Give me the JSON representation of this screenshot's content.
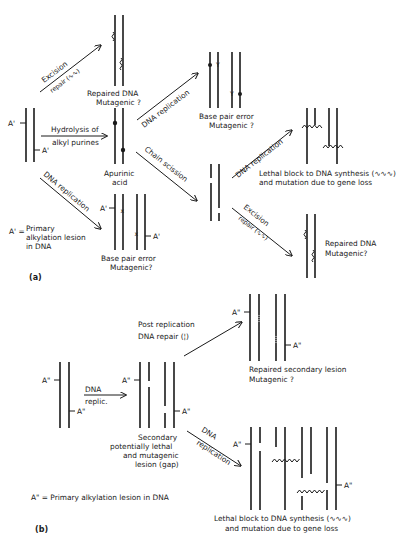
{
  "panel_a": {
    "label": "(a)",
    "start_lesion": "A'",
    "legend_line1": "A' =",
    "legend_line2": "Primary",
    "legend_line3": "alkylation lesion",
    "legend_line4": "in DNA",
    "arrows": {
      "excision_repair_1": "Excision",
      "excision_repair_2": "repair (∿∿)",
      "hydrolysis_1": "Hydrolysis of",
      "hydrolysis_2": "alkyl purines",
      "dna_replication_lower": "DNA replication",
      "dna_replication_upper": "DNA replication",
      "chain_scission": "Chain scission",
      "dna_replication_right": "DNA replication",
      "excision_repair_right_1": "Excision",
      "excision_repair_right_2": "repair (∿∿)"
    },
    "outcomes": {
      "repaired_top_1": "Repaired DNA",
      "repaired_top_2": "Mutagenic ?",
      "apurinic_1": "Apurinic",
      "apurinic_2": "acid",
      "bp_error_top_1": "Base pair error",
      "bp_error_top_2": "Mutagenic ?",
      "bp_error_bottom_1": "Base pair error",
      "bp_error_bottom_2": "Mutagenic?",
      "lethal_1": "Lethal block to DNA synthesis (∿∿∿)",
      "lethal_2": "and mutation due to gene loss",
      "repaired_right_1": "Repaired DNA",
      "repaired_right_2": "Mutagenic?"
    }
  },
  "panel_b": {
    "label": "(b)",
    "lesion": "A\"",
    "legend": "A\" = Primary alkylation lesion in DNA",
    "arrows": {
      "dna_replic_1": "DNA",
      "dna_replic_2": "replic.",
      "post_rep_1": "Post replication",
      "post_rep_2": "DNA repair (¦)",
      "dna_replication_1": "DNA",
      "dna_replication_2": "replication"
    },
    "outcomes": {
      "secondary_1": "Secondary",
      "secondary_2": "potentially lethal",
      "secondary_3": "and mutagenic",
      "secondary_4": "lesion (gap)",
      "repaired_secondary_1": "Repaired secondary lesion",
      "repaired_secondary_2": "Mutagenic ?",
      "lethal_1": "Lethal block to DNA synthesis (∿∿∿)",
      "lethal_2": "and mutation due to gene loss"
    }
  }
}
